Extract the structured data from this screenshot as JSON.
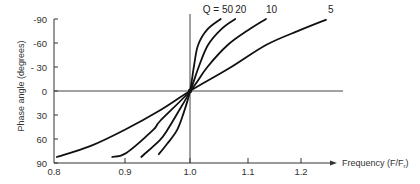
{
  "chart_data": {
    "type": "line",
    "title": "",
    "xlabel": "Frequency  (F/F",
    "xlabel_sub": "r",
    "xlabel_close": ")",
    "ylabel": "Phase  angle   (degrees)",
    "x_ticks": [
      0.8,
      0.9,
      1.0,
      1.1,
      1.2
    ],
    "x_tick_labels": [
      "0.8",
      "0.9",
      "1.0",
      "1.1",
      "1.2"
    ],
    "y_ticks": [
      -90,
      -60,
      -30,
      0,
      30,
      60,
      90
    ],
    "y_tick_labels": [
      "-90",
      "-60",
      "- 30",
      "0",
      "30",
      "60",
      "90"
    ],
    "xlim": [
      0.8,
      1.26
    ],
    "ylim": [
      -90,
      90
    ],
    "y_axis_inverted": true,
    "grid": false,
    "reference_lines": {
      "vertical_at_x": 1.0,
      "horizontal_at_y": 0
    },
    "series": [
      {
        "name": "Q = 50",
        "label": "Q = 50",
        "points": [
          [
            0.952,
            79
          ],
          [
            0.965,
            66
          ],
          [
            0.98,
            49
          ],
          [
            0.99,
            28
          ],
          [
            1.0,
            0
          ],
          [
            1.007,
            -32
          ],
          [
            1.014,
            -57.5
          ],
          [
            1.03,
            -77
          ],
          [
            1.053,
            -90
          ]
        ]
      },
      {
        "name": "Q = 20",
        "label": "20",
        "points": [
          [
            0.925,
            82.5
          ],
          [
            0.954,
            61
          ],
          [
            0.965,
            49
          ],
          [
            0.982,
            26
          ],
          [
            1.0,
            0
          ],
          [
            1.015,
            -30
          ],
          [
            1.031,
            -57.5
          ],
          [
            1.055,
            -78
          ],
          [
            1.078,
            -90
          ]
        ]
      },
      {
        "name": "Q = 10",
        "label": "10",
        "points": [
          [
            0.882,
            82.5
          ],
          [
            0.902,
            77.5
          ],
          [
            0.943,
            49
          ],
          [
            0.954,
            37.5
          ],
          [
            1.0,
            0
          ],
          [
            1.03,
            -30
          ],
          [
            1.065,
            -57.5
          ],
          [
            1.1,
            -76
          ],
          [
            1.134,
            -90
          ]
        ]
      },
      {
        "name": "Q = 5",
        "label": "5",
        "points": [
          [
            0.804,
            82.5
          ],
          [
            0.851,
            69
          ],
          [
            0.902,
            47.5
          ],
          [
            0.954,
            24
          ],
          [
            1.0,
            0
          ],
          [
            1.069,
            -29
          ],
          [
            1.134,
            -57.5
          ],
          [
            1.198,
            -76
          ],
          [
            1.247,
            -89
          ]
        ]
      }
    ]
  }
}
